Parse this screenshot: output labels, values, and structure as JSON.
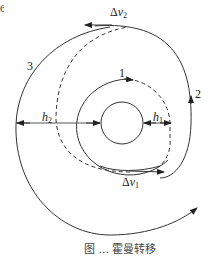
{
  "figure": {
    "type": "Hohmann transfer orbit diagram",
    "labels": {
      "orbit_1": "1",
      "orbit_2": "2",
      "orbit_3": "3",
      "delta_v1": {
        "prefix": "Δ",
        "var": "v",
        "sub": "1"
      },
      "delta_v2": {
        "prefix": "Δ",
        "var": "v",
        "sub": "2"
      },
      "h1": {
        "var": "h",
        "sub": "1"
      },
      "h2": {
        "var": "h",
        "sub": "2"
      }
    },
    "edge_mark": "6",
    "caption": "图 ... 霍曼转移"
  },
  "colors": {
    "line": "#333333",
    "background": "#ffffff"
  }
}
